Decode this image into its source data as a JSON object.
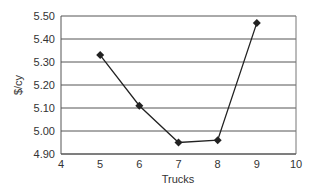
{
  "chart_data": {
    "type": "line",
    "title": "",
    "xlabel": "Trucks",
    "ylabel": "$/cy",
    "x": [
      5,
      6,
      7,
      8,
      9
    ],
    "series": [
      {
        "name": "$/cy",
        "values": [
          5.33,
          5.11,
          4.95,
          4.96,
          5.47
        ],
        "marker": "diamond",
        "color": "#222222"
      }
    ],
    "xlim": [
      4,
      10
    ],
    "ylim": [
      4.9,
      5.5
    ],
    "xticks": [
      "4",
      "5",
      "6",
      "7",
      "8",
      "9",
      "10"
    ],
    "yticks": [
      "5.50",
      "5.40",
      "5.30",
      "5.20",
      "5.10",
      "5.00",
      "4.90"
    ],
    "grid": {
      "horizontal": true,
      "vertical": false
    },
    "legend": null
  }
}
